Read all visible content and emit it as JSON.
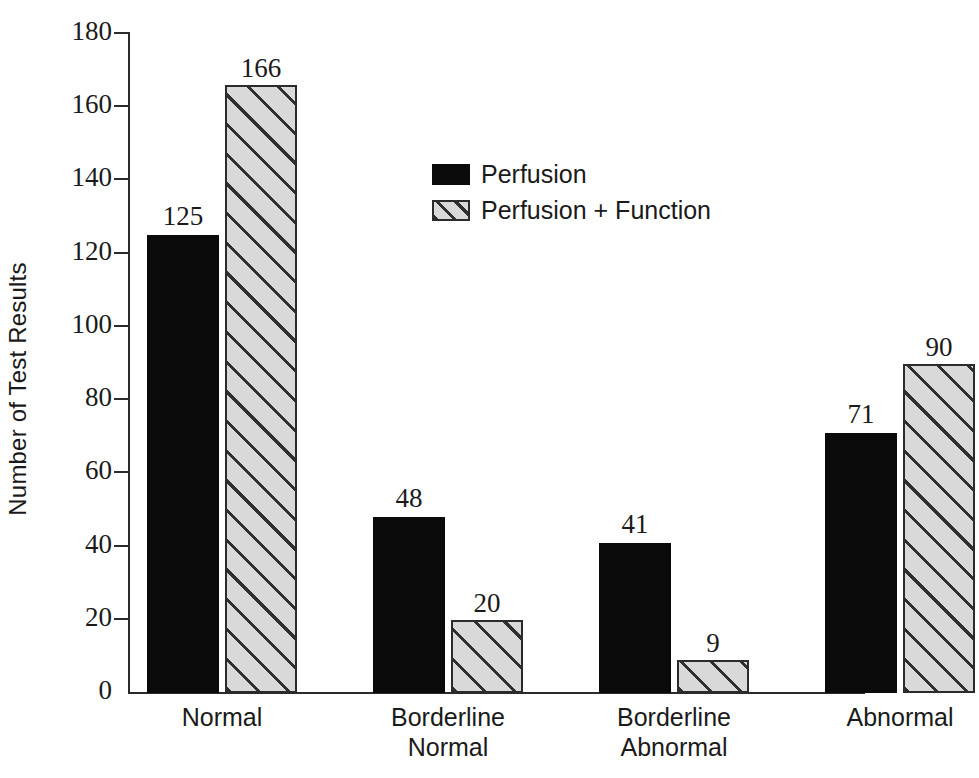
{
  "chart_data": {
    "type": "bar",
    "title": "",
    "xlabel": "",
    "ylabel": "Number of Test Results",
    "ylim": [
      0,
      180
    ],
    "ytick_step": 20,
    "yticks": [
      "180",
      "160",
      "140",
      "120",
      "100",
      "80",
      "60",
      "40",
      "20",
      "0"
    ],
    "categories": [
      "Normal",
      "Borderline\nNormal",
      "Borderline\nAbnormal",
      "Abnormal"
    ],
    "grid": false,
    "legend_position": "upper center",
    "series": [
      {
        "name": "Perfusion",
        "style": "solid-black",
        "values": [
          125,
          48,
          41,
          71
        ],
        "labels": [
          "125",
          "48",
          "41",
          "71"
        ]
      },
      {
        "name": "Perfusion + Function",
        "style": "diagonal-hatch",
        "values": [
          166,
          20,
          9,
          90
        ],
        "labels": [
          "166",
          "20",
          "9",
          "90"
        ]
      }
    ],
    "colors": {
      "series_1_fill": "#0a0a0a",
      "series_2_fill": "#d9d9d9",
      "series_2_hatch": "#2f2f2f",
      "axis": "#2b2b2b",
      "text": "#1a1a1a",
      "background": "#ffffff"
    }
  },
  "legend": {
    "items": [
      {
        "label": "Perfusion",
        "swatch": "solid-swatch"
      },
      {
        "label": "Perfusion + Function",
        "swatch": "hatched-swatch"
      }
    ]
  },
  "axes": {
    "y_title": "Number of Test Results"
  }
}
